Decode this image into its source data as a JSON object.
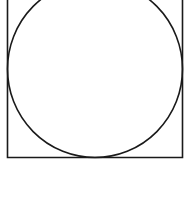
{
  "diagram": {
    "shapes": [
      {
        "type": "square",
        "stroke": "#1a1a1a"
      },
      {
        "type": "circle-inscribed",
        "stroke": "#1a1a1a"
      }
    ],
    "background": "#ffffff"
  }
}
